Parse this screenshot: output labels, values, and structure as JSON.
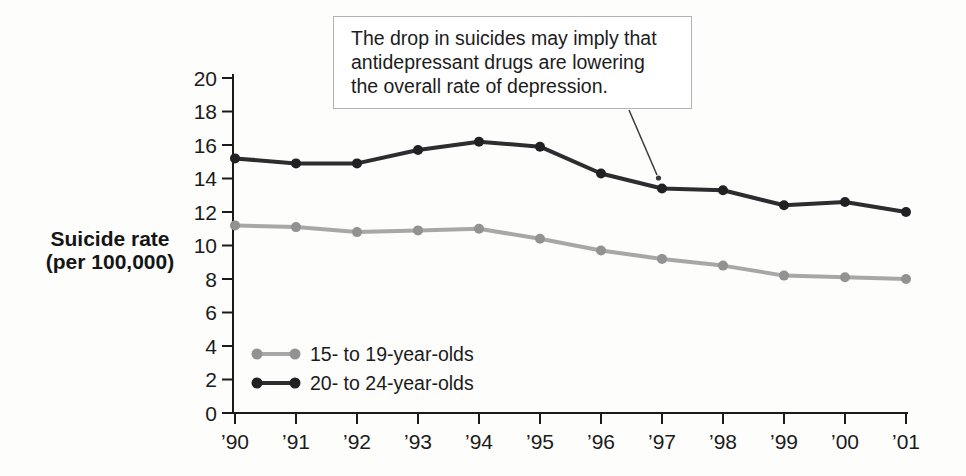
{
  "figure": {
    "y_axis_title": [
      "Suicide rate",
      "(per 100,000)"
    ],
    "annotation": {
      "lines": [
        "The drop in suicides may imply that",
        "antidepressant drugs are lowering",
        "the overall rate of depression."
      ]
    }
  },
  "chart_data": {
    "type": "line",
    "title": "",
    "xlabel": "",
    "ylabel": "Suicide rate (per 100,000)",
    "categories": [
      "’90",
      "’91",
      "’92",
      "’93",
      "’94",
      "’95",
      "’96",
      "’97",
      "’98",
      "’99",
      "’00",
      "’01"
    ],
    "y_ticks": [
      0,
      2,
      4,
      6,
      8,
      10,
      12,
      14,
      16,
      18,
      20
    ],
    "ylim": [
      0,
      20
    ],
    "grid": false,
    "legend_position": "inside-lower-left",
    "series": [
      {
        "name": "15- to 19-year-olds",
        "color": "#a7a7a7",
        "dot_color": "#929292",
        "values": [
          11.2,
          11.1,
          10.8,
          10.9,
          11.0,
          10.4,
          9.7,
          9.2,
          8.8,
          8.2,
          8.1,
          8.0
        ]
      },
      {
        "name": "20- to 24-year-olds",
        "color": "#2d2d30",
        "dot_color": "#212124",
        "values": [
          15.2,
          14.9,
          14.9,
          15.7,
          16.2,
          15.9,
          14.3,
          13.4,
          13.3,
          12.4,
          12.6,
          12.0
        ]
      }
    ]
  }
}
